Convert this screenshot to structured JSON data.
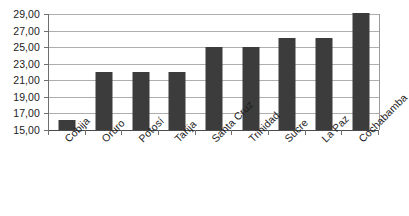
{
  "chart_data": {
    "type": "bar",
    "title": "",
    "subtitle": "",
    "xlabel": "",
    "ylabel": "",
    "categories": [
      "Cobija",
      "Oruro",
      "Potosí",
      "Tarija",
      "Santa Cruz",
      "Trinidad",
      "Sucre",
      "La Paz",
      "Cochabamba"
    ],
    "values": [
      16.2,
      22.0,
      22.0,
      22.0,
      25.0,
      25.0,
      26.1,
      26.1,
      29.1
    ],
    "series": [
      {
        "name": "",
        "values": [
          16.2,
          22.0,
          22.0,
          22.0,
          25.0,
          25.0,
          26.1,
          26.1,
          29.1
        ]
      }
    ],
    "ylim": [
      15,
      29
    ],
    "ytick_values": [
      15,
      17,
      19,
      21,
      23,
      25,
      27,
      29
    ],
    "ytick_labels": [
      "15,00",
      "17,00",
      "19,00",
      "21,00",
      "23,00",
      "25,00",
      "27,00",
      "29,00"
    ],
    "grid": true,
    "grid_axis": "y",
    "legend": false,
    "legend_position": "none",
    "bar_color": "#3c3c3c",
    "gridline_color": "#aeaeae",
    "axis_color": "#6e6e6e",
    "background_color": "#ffffff",
    "xtick_label_rotation": -45,
    "decimal_separator": ","
  }
}
